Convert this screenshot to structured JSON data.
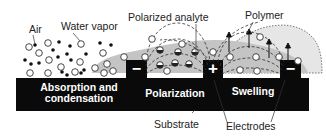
{
  "figure": {
    "labels": {
      "air": "Air",
      "water_vapor": "Water vapor",
      "polarized_analyte": "Polarized analyte",
      "polymer": "Polymer",
      "substrate": "Substrate",
      "electrodes": "Electrodes"
    },
    "stages": [
      {
        "label_line1": "Absorption and",
        "label_line2": "condensation"
      },
      {
        "label_line1": "Polarization"
      },
      {
        "label_line1": "Swelling"
      }
    ],
    "electrodes": [
      {
        "sign": "−",
        "polarity": "negative"
      },
      {
        "sign": "+",
        "polarity": "positive"
      },
      {
        "sign": "−",
        "polarity": "negative"
      }
    ],
    "colors": {
      "substrate": "#0a0a0a",
      "polymer_fill": "#c4c4c4",
      "swollen_polymer_fill": "#e4e4e4",
      "molecule_outline": "#333333",
      "text": "#222222"
    }
  }
}
